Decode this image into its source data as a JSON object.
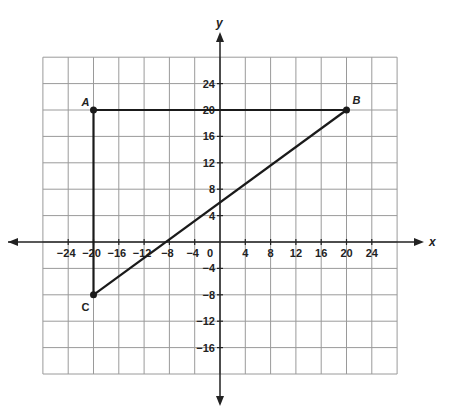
{
  "chart_data": {
    "type": "scatter",
    "title": "",
    "xlabel": "x",
    "ylabel": "y",
    "xlim": [
      -28,
      28
    ],
    "ylim": [
      -20,
      28
    ],
    "grid": true,
    "grid_step": 4,
    "x_ticks": [
      -24,
      -20,
      -16,
      -12,
      -8,
      -4,
      4,
      8,
      12,
      16,
      20,
      24
    ],
    "y_ticks": [
      24,
      20,
      16,
      12,
      8,
      4,
      -4,
      -8,
      -12,
      -16
    ],
    "origin_label": "0",
    "points": [
      {
        "label": "A",
        "x": -20,
        "y": 20
      },
      {
        "label": "B",
        "x": 20,
        "y": 20
      },
      {
        "label": "C",
        "x": -20,
        "y": -8
      }
    ],
    "segments": [
      {
        "from": "A",
        "to": "B"
      },
      {
        "from": "A",
        "to": "C"
      },
      {
        "from": "C",
        "to": "B"
      }
    ]
  },
  "colors": {
    "grid": "#9a9a9a",
    "axis": "#222222",
    "shape": "#1a1a1a"
  }
}
